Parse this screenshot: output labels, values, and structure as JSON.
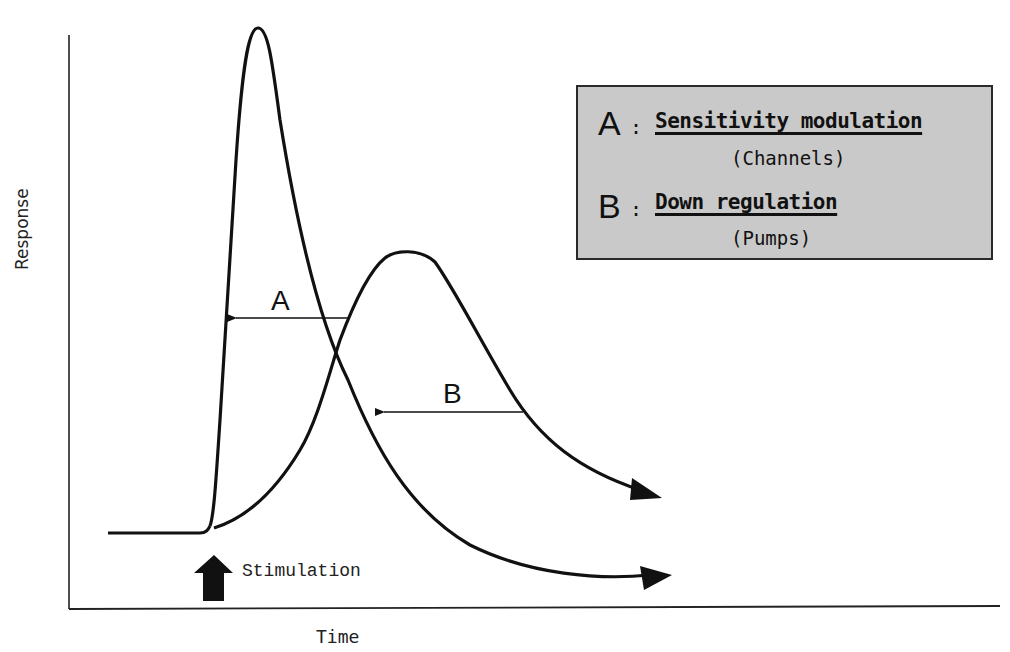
{
  "figure": {
    "type": "response-time diagram",
    "axes": {
      "x_label": "Time",
      "y_label": "Response"
    },
    "stimulus": {
      "label": "Stimulation",
      "icon": "up-arrow-icon"
    },
    "curves": [
      {
        "id": "A",
        "label": "A",
        "description": "sharp, tall, fast-decaying response"
      },
      {
        "id": "B",
        "label": "B",
        "description": "slower, broader, lower-amplitude response"
      }
    ],
    "legend": {
      "items": [
        {
          "letter": "A",
          "separator": ":",
          "title": "Sensitivity modulation",
          "subtitle": "(Channels)"
        },
        {
          "letter": "B",
          "separator": ":",
          "title": "Down regulation",
          "subtitle": "(Pumps)"
        }
      ],
      "background": "#c9c9c9"
    },
    "colors": {
      "ink": "#111111",
      "background": "#ffffff"
    }
  }
}
